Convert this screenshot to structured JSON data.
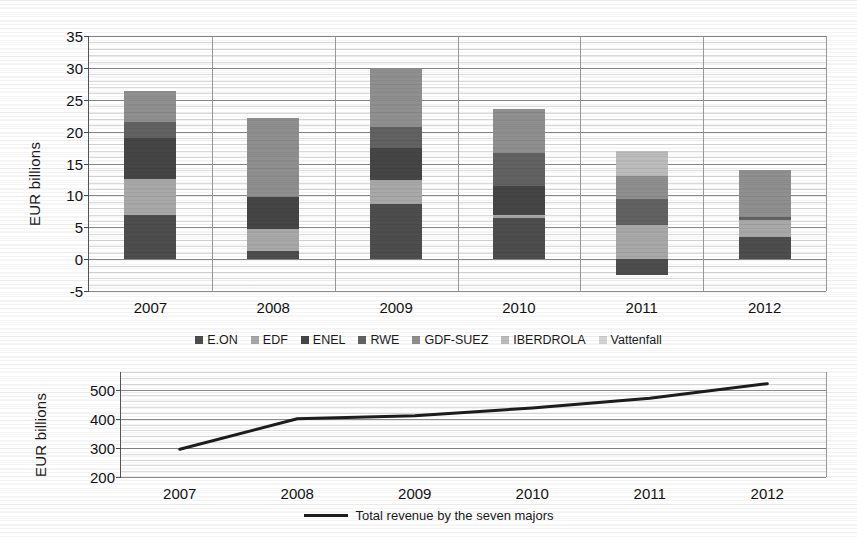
{
  "chart_data": [
    {
      "id": "stacked-bars",
      "type": "bar",
      "stacked": true,
      "title": "",
      "xlabel": "",
      "ylabel": "EUR billions",
      "categories": [
        "2007",
        "2008",
        "2009",
        "2010",
        "2011",
        "2012"
      ],
      "ylim": [
        -5,
        35
      ],
      "yticks": [
        -5,
        0,
        5,
        10,
        15,
        20,
        25,
        30,
        35
      ],
      "grid": true,
      "legend_position": "bottom",
      "series": [
        {
          "name": "E.ON",
          "color": "#4d4d4d",
          "values": [
            7.0,
            1.2,
            8.7,
            6.4,
            -2.5,
            3.5
          ]
        },
        {
          "name": "EDF",
          "color": "#a8a8a8",
          "values": [
            5.5,
            3.6,
            3.7,
            0.5,
            5.3,
            2.7
          ]
        },
        {
          "name": "ENEL",
          "color": "#454545",
          "values": [
            6.5,
            5.0,
            5.1,
            4.6,
            0.0,
            0.0
          ]
        },
        {
          "name": "RWE",
          "color": "#626262",
          "values": [
            2.5,
            0.0,
            3.2,
            5.1,
            4.2,
            0.4
          ]
        },
        {
          "name": "GDF-SUEZ",
          "color": "#8f8f8f",
          "values": [
            4.8,
            12.3,
            9.3,
            6.9,
            3.5,
            7.4
          ]
        },
        {
          "name": "IBERDROLA",
          "color": "#bcbcbc",
          "values": [
            0.0,
            0.0,
            0.0,
            0.0,
            4.0,
            0.0
          ]
        },
        {
          "name": "Vattenfall",
          "color": "#d4d4d4",
          "values": [
            0.0,
            0.0,
            0.0,
            0.0,
            0.0,
            0.0
          ]
        }
      ],
      "totals": [
        26.3,
        22.1,
        30.0,
        23.5,
        17.0,
        14.0
      ]
    },
    {
      "id": "total-revenue-line",
      "type": "line",
      "title": "",
      "xlabel": "",
      "ylabel": "EUR billions",
      "x": [
        "2007",
        "2008",
        "2009",
        "2010",
        "2011",
        "2012"
      ],
      "ylim": [
        200,
        560
      ],
      "yticks": [
        200,
        300,
        400,
        500
      ],
      "grid": true,
      "legend_position": "bottom",
      "series": [
        {
          "name": "Total revenue by the seven majors",
          "color": "#1d1d1d",
          "values": [
            295,
            400,
            410,
            437,
            470,
            520
          ]
        }
      ]
    }
  ],
  "top": {
    "ylabel": "EUR billions",
    "yticks": [
      "35",
      "30",
      "25",
      "20",
      "15",
      "10",
      "5",
      "0",
      "-5"
    ],
    "xticks": [
      "2007",
      "2008",
      "2009",
      "2010",
      "2011",
      "2012"
    ],
    "legend": [
      {
        "label": "E.ON",
        "color": "#4d4d4d"
      },
      {
        "label": "EDF",
        "color": "#a8a8a8"
      },
      {
        "label": "ENEL",
        "color": "#454545"
      },
      {
        "label": "RWE",
        "color": "#626262"
      },
      {
        "label": "GDF-SUEZ",
        "color": "#8f8f8f"
      },
      {
        "label": "IBERDROLA",
        "color": "#bcbcbc"
      },
      {
        "label": "Vattenfall",
        "color": "#d4d4d4"
      }
    ]
  },
  "bottom": {
    "ylabel": "EUR billions",
    "yticks": [
      "500",
      "400",
      "300",
      "200"
    ],
    "xticks": [
      "2007",
      "2008",
      "2009",
      "2010",
      "2011",
      "2012"
    ],
    "legend_label": "Total revenue by the seven majors"
  }
}
